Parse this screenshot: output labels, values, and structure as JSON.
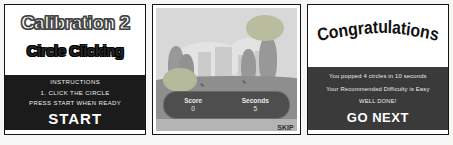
{
  "panels": {
    "intro": {
      "title": "Calibration 2",
      "subtitle": "Circle Clicking",
      "instructions_heading": "INSTRUCTIONS",
      "instruction_line1": "1. CLICK THE CIRCLE",
      "instruction_line2": "PRESS START WHEN READY",
      "start_label": "START"
    },
    "game": {
      "score_label": "Score",
      "score_value": "0",
      "seconds_label": "Seconds",
      "seconds_value": "5",
      "skip_label": "SKIP"
    },
    "results": {
      "title": "Congratulations",
      "line1": "You popped 4 circles in 10 seconds",
      "line2": "Your Recommended Difficulty is Easy",
      "line3": "WELL DONE!",
      "next_label": "GO NEXT"
    }
  },
  "colors": {
    "intro_panel_dark": "#1b1b1b",
    "results_panel_dark": "#3a3a3a",
    "scene_sky": "#d8d8d8",
    "scene_ground": "#8e8e8e",
    "target_circle": "#b9bd9e",
    "tree": "#989898",
    "score_pill": "#4e4e4e",
    "panel_border": "#141414"
  }
}
